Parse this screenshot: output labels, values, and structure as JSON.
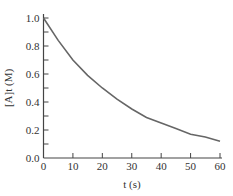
{
  "chart_data": {
    "type": "line",
    "title": "",
    "xlabel": "t (s)",
    "ylabel": "[A]t (M)",
    "xlim": [
      0,
      60
    ],
    "ylim": [
      0,
      1.0
    ],
    "x_ticks": [
      "0",
      "10",
      "20",
      "30",
      "40",
      "50",
      "60"
    ],
    "y_ticks": [
      "0.0",
      "0.2",
      "0.4",
      "0.6",
      "0.8",
      "1.0"
    ],
    "grid": false,
    "legend": null,
    "series": [
      {
        "name": "[A]t",
        "x": [
          0,
          5,
          10,
          15,
          20,
          25,
          30,
          35,
          40,
          45,
          50,
          55,
          60
        ],
        "values": [
          1.0,
          0.84,
          0.7,
          0.59,
          0.5,
          0.42,
          0.35,
          0.29,
          0.25,
          0.21,
          0.17,
          0.15,
          0.12
        ],
        "color": "#666666"
      }
    ]
  },
  "colors": {
    "axis": "#444444",
    "curve": "#666666"
  }
}
